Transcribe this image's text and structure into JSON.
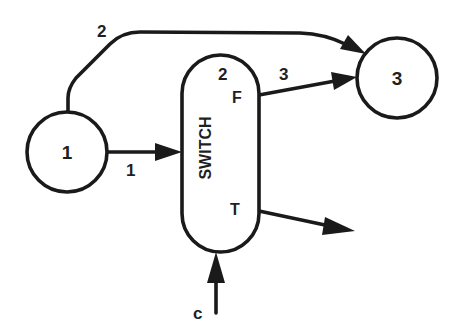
{
  "diagram": {
    "type": "dataflow-switch",
    "colors": {
      "ink": "#1a1a1a",
      "background": "#ffffff"
    },
    "nodes": [
      {
        "id": "n1",
        "label": "1",
        "shape": "circle"
      },
      {
        "id": "switch",
        "label": "SWITCH",
        "shape": "pill",
        "port_labels": {
          "top_number": "2",
          "false": "F",
          "true": "T"
        }
      },
      {
        "id": "n3",
        "label": "3",
        "shape": "circle"
      }
    ],
    "edges": [
      {
        "id": "e1",
        "from": "n1",
        "to": "switch",
        "label": "1"
      },
      {
        "id": "e2",
        "from": "n1",
        "to": "n3",
        "label": "2"
      },
      {
        "id": "e3",
        "from": "switch.F",
        "to": "n3",
        "label": "3"
      },
      {
        "id": "eT",
        "from": "switch.T",
        "to": "",
        "label": ""
      },
      {
        "id": "ec",
        "from": "",
        "to": "switch",
        "label": "c"
      }
    ]
  }
}
